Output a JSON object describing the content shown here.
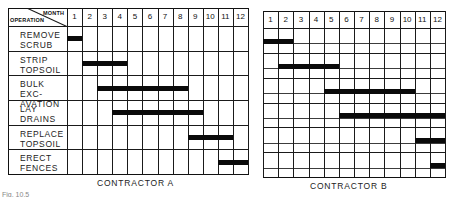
{
  "chart_data": {
    "type": "gantt",
    "title": "",
    "header": {
      "row_header": "OPERATION",
      "column_header": "MONTH"
    },
    "months": [
      "1",
      "2",
      "3",
      "4",
      "5",
      "6",
      "7",
      "8",
      "9",
      "10",
      "11",
      "12"
    ],
    "operations": [
      "REMOVE SCRUB",
      "STRIP TOPSOIL",
      "BULK EXCAVATION",
      "LAY DRAINS",
      "REPLACE TOPSOIL",
      "ERECT FENCES"
    ],
    "operation_lines": [
      [
        "REMOVE",
        "SCRUB"
      ],
      [
        "STRIP",
        "TOPSOIL"
      ],
      [
        "BULK EXC-",
        "AVATION"
      ],
      [
        "LAY",
        "DRAINS"
      ],
      [
        "REPLACE",
        "TOPSOIL"
      ],
      [
        "ERECT",
        "FENCES"
      ]
    ],
    "series": [
      {
        "name": "CONTRACTOR A",
        "bars": [
          {
            "operation": "REMOVE SCRUB",
            "start_month": 1,
            "end_month": 1
          },
          {
            "operation": "STRIP TOPSOIL",
            "start_month": 2,
            "end_month": 4
          },
          {
            "operation": "BULK EXCAVATION",
            "start_month": 3,
            "end_month": 8
          },
          {
            "operation": "LAY DRAINS",
            "start_month": 4,
            "end_month": 9
          },
          {
            "operation": "REPLACE TOPSOIL",
            "start_month": 9,
            "end_month": 11
          },
          {
            "operation": "ERECT FENCES",
            "start_month": 11,
            "end_month": 12
          }
        ]
      },
      {
        "name": "CONTRACTOR B",
        "bars": [
          {
            "operation": "REMOVE SCRUB",
            "start_month": 1,
            "end_month": 2
          },
          {
            "operation": "STRIP TOPSOIL",
            "start_month": 2,
            "end_month": 5
          },
          {
            "operation": "BULK EXCAVATION",
            "start_month": 5,
            "end_month": 10
          },
          {
            "operation": "LAY DRAINS",
            "start_month": 6,
            "end_month": 12
          },
          {
            "operation": "REPLACE TOPSOIL",
            "start_month": 11,
            "end_month": 12
          },
          {
            "operation": "ERECT FENCES",
            "start_month": 12,
            "end_month": 12
          }
        ]
      }
    ],
    "grid": true
  },
  "labels": {
    "contractor_a": "CONTRACTOR A",
    "contractor_b": "CONTRACTOR B",
    "caption": "Fig. 10.5"
  }
}
